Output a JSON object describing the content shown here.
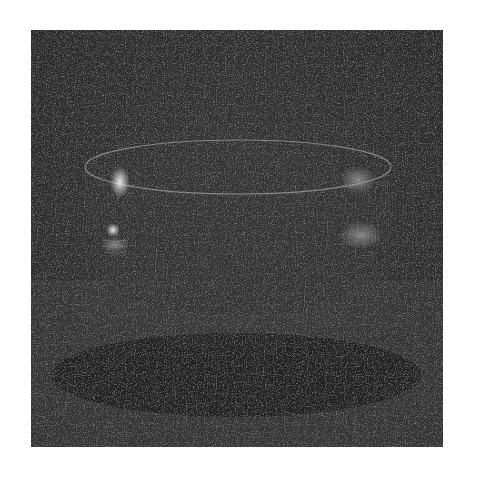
{
  "image": {
    "subject": "glass bowl on dark background",
    "style": "grainy grayscale photograph",
    "colors": {
      "background": "#2e2e2e",
      "page": "#ffffff",
      "highlight": "#e8e8e8",
      "shadow": "#1c1c1c"
    }
  }
}
